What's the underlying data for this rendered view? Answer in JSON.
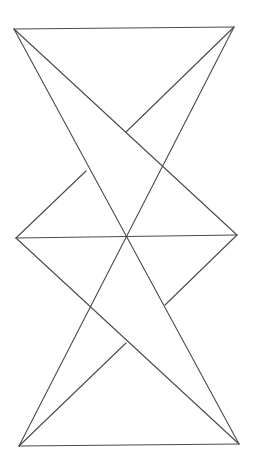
{
  "diagram": {
    "type": "geometric-line-figure",
    "stroke_color": "#4a4a4a",
    "stroke_width": 1.1,
    "background": "#ffffff",
    "vertices": {
      "top_left": [
        14,
        29
      ],
      "top_right": [
        234,
        27
      ],
      "middle_left": [
        16,
        238
      ],
      "middle_right": [
        237,
        235
      ],
      "bottom_left": [
        19,
        446
      ],
      "bottom_right": [
        239,
        444
      ],
      "center": [
        127,
        237
      ]
    },
    "segments": [
      {
        "name": "top-edge",
        "from": [
          14,
          29
        ],
        "to": [
          234,
          27
        ]
      },
      {
        "name": "bottom-edge",
        "from": [
          19,
          446
        ],
        "to": [
          239,
          444
        ]
      },
      {
        "name": "middle-horizontal",
        "from": [
          16,
          238
        ],
        "to": [
          237,
          235
        ]
      },
      {
        "name": "diagonal-tl-to-br",
        "from": [
          14,
          29
        ],
        "to": [
          239,
          444
        ]
      },
      {
        "name": "diagonal-tr-to-bl",
        "from": [
          234,
          27
        ],
        "to": [
          19,
          446
        ]
      },
      {
        "name": "diagonal-tl-to-mr",
        "from": [
          14,
          29
        ],
        "to": [
          237,
          235
        ]
      },
      {
        "name": "diagonal-ml-to-br",
        "from": [
          16,
          238
        ],
        "to": [
          239,
          444
        ]
      },
      {
        "name": "short-tr-upper",
        "from": [
          234,
          27
        ],
        "to": [
          126,
          132
        ]
      },
      {
        "name": "short-ml-upper",
        "from": [
          16,
          238
        ],
        "to": [
          86,
          171
        ]
      },
      {
        "name": "short-mr-lower",
        "from": [
          237,
          235
        ],
        "to": [
          165,
          305
        ]
      },
      {
        "name": "short-bl-lower",
        "from": [
          19,
          446
        ],
        "to": [
          126,
          343
        ]
      }
    ]
  }
}
